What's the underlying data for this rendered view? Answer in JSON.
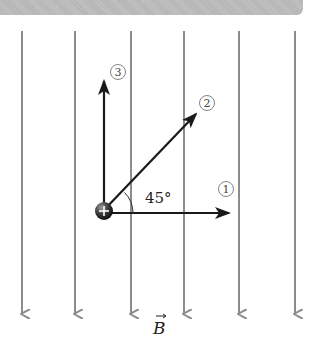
{
  "diagram": {
    "colors": {
      "field_line": "#8c8c8c",
      "velocity_arrow": "#1a1a1a",
      "charge": "#3a3a3a",
      "band": "#bdbdbd"
    },
    "field": {
      "label": "B",
      "direction": "down",
      "line_x": [
        22,
        75,
        131,
        184,
        239,
        295
      ]
    },
    "charge": {
      "sign": "+",
      "x": 104,
      "y": 212
    },
    "vectors": [
      {
        "id": "1",
        "label": "①",
        "direction": "right",
        "angle_deg": 0
      },
      {
        "id": "2",
        "label": "②",
        "direction": "up-right",
        "angle_deg": 45
      },
      {
        "id": "3",
        "label": "③",
        "direction": "up",
        "angle_deg": 90
      }
    ],
    "angle_label": "45°"
  }
}
